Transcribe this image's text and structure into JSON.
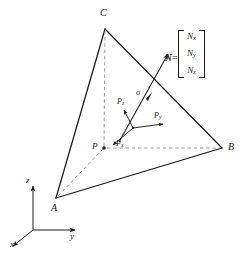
{
  "figure": {
    "background_color": "#ffffff",
    "line_color": "#1a1a1a",
    "dashed_color": "#8c8c8c",
    "width": 245,
    "height": 253
  },
  "vertices": {
    "a_label": "A",
    "b_label": "B",
    "c_label": "C",
    "p_label": "P"
  },
  "axes": {
    "x_label": "x",
    "y_label": "y",
    "z_label": "z"
  },
  "traction": {
    "sigma_label": "σ",
    "px_label": "P",
    "px_sub": "x",
    "py_label": "P",
    "py_sub": "y",
    "pz_label": "P",
    "pz_sub": "z"
  },
  "normal": {
    "symbol": "N",
    "equals": "=",
    "components": [
      {
        "base": "N",
        "sub": "x"
      },
      {
        "base": "N",
        "sub": "y"
      },
      {
        "base": "N",
        "sub": "z"
      }
    ]
  },
  "cropped_caption": ""
}
